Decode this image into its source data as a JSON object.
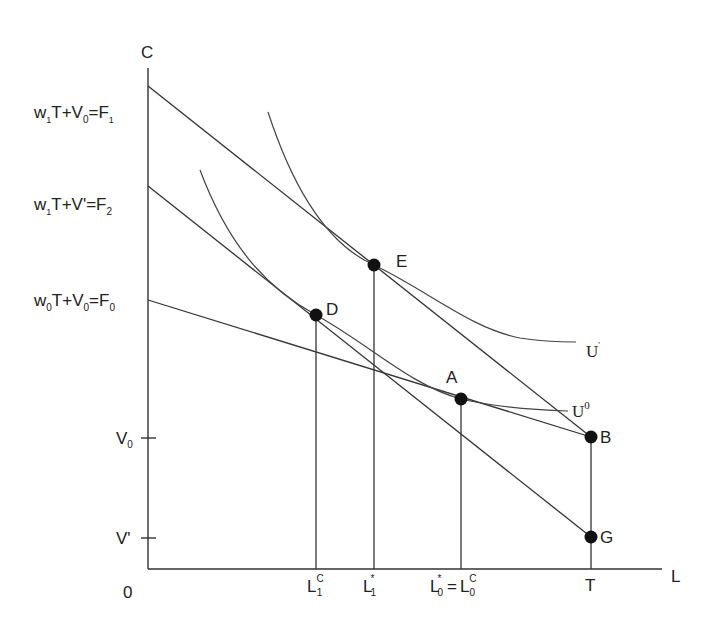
{
  "axes": {
    "y_label": "C",
    "x_label": "L",
    "origin_label": "0"
  },
  "y_ticks": {
    "F1": {
      "main": "w",
      "sub1": "1",
      "mid": "T+V",
      "sub2": "0",
      "eq": "=F",
      "sub3": "1"
    },
    "F2": {
      "main": "w",
      "sub1": "1",
      "mid": "T+V'=F",
      "sub3": "2"
    },
    "F0": {
      "main": "w",
      "sub1": "0",
      "mid": "T+V",
      "sub2": "0",
      "eq": "=F",
      "sub3": "0"
    },
    "V0": {
      "main": "V",
      "sub": "0"
    },
    "Vprime": {
      "main": "V'"
    }
  },
  "x_ticks": {
    "L1C": {
      "main": "L",
      "sub": "1",
      "sup": "C"
    },
    "L1star": {
      "main": "L",
      "sub": "1",
      "sup": "*"
    },
    "L0star": {
      "main": "L",
      "sub": "0",
      "sup": "*",
      "eq": "=",
      "main2": "L",
      "sub2": "0",
      "sup2": "C"
    },
    "T": {
      "main": "T"
    }
  },
  "points": {
    "A": "A",
    "B": "B",
    "D": "D",
    "E": "E",
    "G": "G"
  },
  "curves": {
    "U_prime": {
      "main": "U",
      "sup": "'"
    },
    "U0": {
      "main": "U",
      "sup": "0"
    }
  }
}
